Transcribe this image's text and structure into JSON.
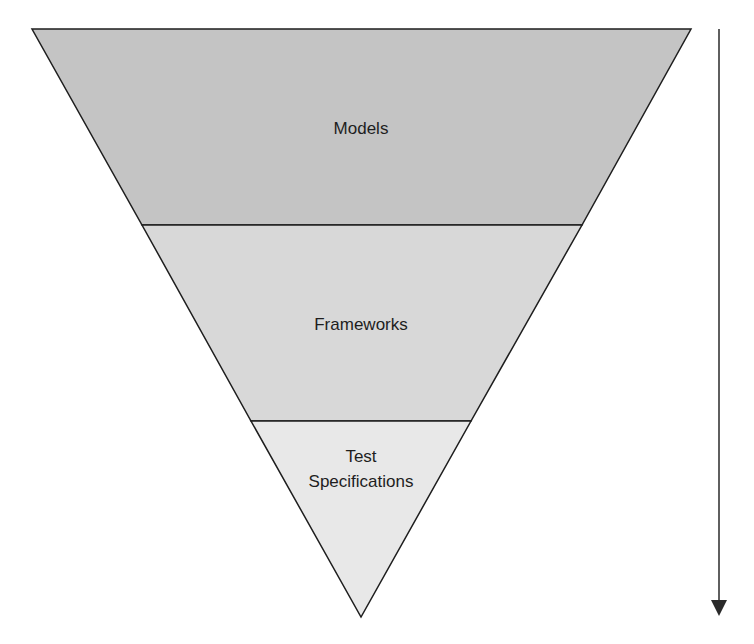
{
  "diagram": {
    "type": "inverted-pyramid",
    "layers": [
      {
        "label_lines": [
          "Models"
        ],
        "fill": "#c4c4c4"
      },
      {
        "label_lines": [
          "Frameworks"
        ],
        "fill": "#d8d8d8"
      },
      {
        "label_lines": [
          "Test",
          "Specifications"
        ],
        "fill": "#e8e8e8"
      }
    ],
    "arrow": {
      "direction": "down",
      "color": "#2a2a2a"
    },
    "outline_color": "#1e1e1e"
  }
}
